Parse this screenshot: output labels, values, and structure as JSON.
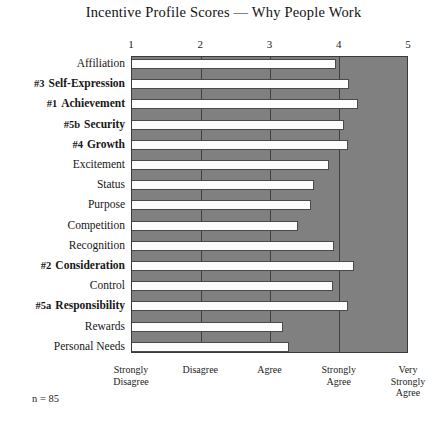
{
  "chart_data": {
    "type": "bar",
    "orientation": "horizontal",
    "title": "Incentive Profile Scores — Why People Work",
    "xlabel": "",
    "ylabel": "",
    "xlim": [
      1,
      5
    ],
    "grid": true,
    "legend": "none",
    "tick_labels": [
      "1",
      "2",
      "3",
      "4",
      "5"
    ],
    "tick_values": [
      1,
      2,
      3,
      4,
      5
    ],
    "scale_labels": [
      {
        "value": 1,
        "text": "Strongly\nDisagree"
      },
      {
        "value": 2,
        "text": "Disagree"
      },
      {
        "value": 3,
        "text": "Agree"
      },
      {
        "value": 4,
        "text": "Strongly\nAgree"
      },
      {
        "value": 5,
        "text": "Very\nStrongly\nAgree"
      }
    ],
    "categories": [
      "Affiliation",
      "Self-Expression",
      "Achievement",
      "Security",
      "Growth",
      "Excitement",
      "Status",
      "Purpose",
      "Competition",
      "Recognition",
      "Consideration",
      "Control",
      "Responsibility",
      "Rewards",
      "Personal Needs"
    ],
    "values": [
      3.95,
      4.13,
      4.26,
      4.06,
      4.12,
      3.85,
      3.63,
      3.58,
      3.4,
      3.92,
      4.21,
      3.9,
      4.12,
      3.18,
      3.27
    ],
    "rank_annotations": [
      {
        "category": "Self-Expression",
        "rank": "#3"
      },
      {
        "category": "Achievement",
        "rank": "#1"
      },
      {
        "category": "Security",
        "rank": "#5b"
      },
      {
        "category": "Growth",
        "rank": "#4"
      },
      {
        "category": "Consideration",
        "rank": "#2"
      },
      {
        "category": "Responsibility",
        "rank": "#5a"
      }
    ],
    "annotations": [
      "n = 85"
    ],
    "colors": {
      "plot_background": "#808080",
      "bar_fill": "#fdfdfd",
      "bar_border": "#4a4a4a",
      "gridline": "#3f3f3f",
      "text": "#171717"
    }
  },
  "footnote": {
    "sample_size": "n = 85"
  }
}
